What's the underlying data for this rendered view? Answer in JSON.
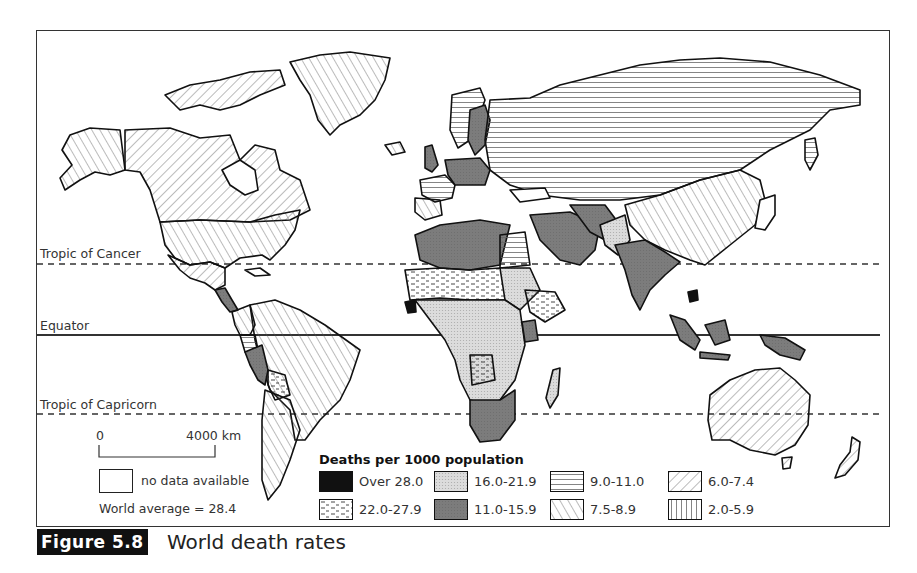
{
  "map": {
    "latitude_lines": [
      {
        "label": "Tropic of Cancer",
        "style": "dashed"
      },
      {
        "label": "Equator",
        "style": "solid"
      },
      {
        "label": "Tropic of Capricorn",
        "style": "dashed"
      }
    ],
    "scale": {
      "start": "0",
      "end": "4000 km"
    },
    "no_data_label": "no data available",
    "world_average": "World average = 28.4"
  },
  "legend": {
    "title": "Deaths per 1000 population",
    "items": [
      {
        "label": "Over 28.0",
        "pattern": "solid-black"
      },
      {
        "label": "22.0-27.9",
        "pattern": "dashes"
      },
      {
        "label": "16.0-21.9",
        "pattern": "light-stipple"
      },
      {
        "label": "11.0-15.9",
        "pattern": "dark-grey"
      },
      {
        "label": "9.0-11.0",
        "pattern": "horizontal-lines"
      },
      {
        "label": "7.5-8.9",
        "pattern": "back-diagonal"
      },
      {
        "label": "6.0-7.4",
        "pattern": "forward-diagonal"
      },
      {
        "label": "2.0-5.9",
        "pattern": "vertical-lines"
      }
    ]
  },
  "caption": {
    "figure_number": "Figure 5.8",
    "title": "World death rates"
  },
  "colors": {
    "dark_grey": "#7a7a7a",
    "light_stipple": "#d6d6d6",
    "black": "#111111",
    "line": "#222222"
  }
}
